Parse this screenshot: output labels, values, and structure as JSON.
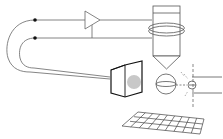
{
  "diagram": {
    "type": "schematic",
    "colors": {
      "background": "#ffffff",
      "line": "#555555",
      "dark_line": "#222222",
      "spot": "#c8c8c8",
      "grid": "#444444"
    },
    "components": [
      {
        "id": "junction-top",
        "icon": "junction-dot"
      },
      {
        "id": "junction-bottom",
        "icon": "junction-dot"
      },
      {
        "id": "amplifier",
        "icon": "triangle-amplifier"
      },
      {
        "id": "probe",
        "icon": "probe-tip"
      },
      {
        "id": "coil",
        "icon": "coil-ring"
      },
      {
        "id": "detector",
        "icon": "detector-box"
      },
      {
        "id": "sphere",
        "icon": "sphere"
      },
      {
        "id": "lens",
        "icon": "lens-eye"
      },
      {
        "id": "sample-grid",
        "icon": "perspective-grid"
      }
    ]
  }
}
